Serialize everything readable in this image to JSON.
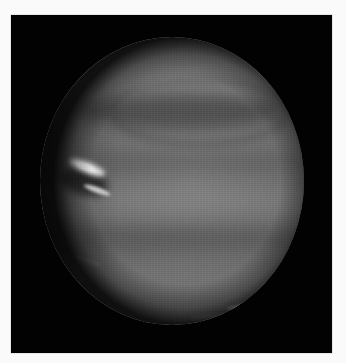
{
  "image": {
    "subject": "planet",
    "description": "Grayscale photograph of a banded gas giant (Neptune-like) against black space, with bright white cloud features on the left limb and a thin bright streak near the southern limb",
    "colors": {
      "page_background": "#fafafa",
      "space": "#020202",
      "planet_base": "#6a6a6a",
      "cloud_highlight": "#f4f4f4"
    },
    "features": [
      {
        "name": "bright-cloud-upper-left",
        "position": "left limb, mid-upper"
      },
      {
        "name": "bright-cloud-lower-left",
        "position": "left limb, below upper cloud"
      },
      {
        "name": "dark-spot",
        "position": "left limb, between bright clouds"
      },
      {
        "name": "dark-polar-band",
        "position": "northern hemisphere"
      },
      {
        "name": "bright-streak-south",
        "position": "southern limb, lower right"
      }
    ]
  }
}
